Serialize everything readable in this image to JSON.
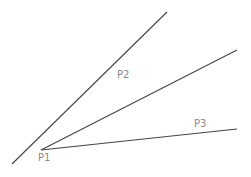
{
  "diagram": {
    "lines": [
      {
        "id": "line-p1-p2",
        "x1": 12,
        "y1": 164,
        "x2": 167,
        "y2": 12
      },
      {
        "id": "line-p1-mid",
        "x1": 41,
        "y1": 150,
        "x2": 237,
        "y2": 50
      },
      {
        "id": "line-p1-p3",
        "x1": 41,
        "y1": 150,
        "x2": 237,
        "y2": 129
      }
    ],
    "labels": {
      "p1": {
        "text": "P1",
        "x": 38,
        "y": 161
      },
      "p2": {
        "text": "P2",
        "x": 117,
        "y": 78
      },
      "p3": {
        "text": "P3",
        "x": 194,
        "y": 127
      }
    },
    "colors": {
      "line": "#444444",
      "label": "#8a8a8a",
      "background": "#ffffff"
    }
  }
}
